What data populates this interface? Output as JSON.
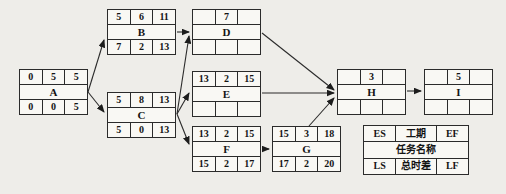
{
  "diagram": {
    "type": "activity-on-node-network",
    "nodes": {
      "A": {
        "name": "A",
        "es": "0",
        "dur": "5",
        "ef": "5",
        "ls": "0",
        "tf": "0",
        "lf": "5"
      },
      "B": {
        "name": "B",
        "es": "5",
        "dur": "6",
        "ef": "11",
        "ls": "7",
        "tf": "2",
        "lf": "13"
      },
      "C": {
        "name": "C",
        "es": "5",
        "dur": "8",
        "ef": "13",
        "ls": "5",
        "tf": "0",
        "lf": "13"
      },
      "D": {
        "name": "D",
        "es": "",
        "dur": "7",
        "ef": "",
        "ls": "",
        "tf": "",
        "lf": ""
      },
      "E": {
        "name": "E",
        "es": "13",
        "dur": "2",
        "ef": "15",
        "ls": "",
        "tf": "",
        "lf": ""
      },
      "F": {
        "name": "F",
        "es": "13",
        "dur": "2",
        "ef": "15",
        "ls": "15",
        "tf": "2",
        "lf": "17"
      },
      "G": {
        "name": "G",
        "es": "15",
        "dur": "3",
        "ef": "18",
        "ls": "17",
        "tf": "2",
        "lf": "20"
      },
      "H": {
        "name": "H",
        "es": "",
        "dur": "3",
        "ef": "",
        "ls": "",
        "tf": "",
        "lf": ""
      },
      "I": {
        "name": "I",
        "es": "",
        "dur": "5",
        "ef": "",
        "ls": "",
        "tf": "",
        "lf": ""
      }
    },
    "edges": [
      {
        "from": "A",
        "to": "B"
      },
      {
        "from": "A",
        "to": "C"
      },
      {
        "from": "B",
        "to": "D"
      },
      {
        "from": "C",
        "to": "D"
      },
      {
        "from": "C",
        "to": "E"
      },
      {
        "from": "C",
        "to": "F"
      },
      {
        "from": "D",
        "to": "H"
      },
      {
        "from": "E",
        "to": "H"
      },
      {
        "from": "F",
        "to": "G"
      },
      {
        "from": "G",
        "to": "H"
      },
      {
        "from": "H",
        "to": "I"
      }
    ],
    "legend": {
      "es": "ES",
      "dur": "工期",
      "ef": "EF",
      "name": "任务名称",
      "ls": "LS",
      "tf": "总时差",
      "lf": "LF"
    },
    "colors": {
      "background": "#eeede9",
      "cell_fill": "#f9f8f4",
      "line": "#2b2b2b",
      "text": "#141414"
    }
  }
}
